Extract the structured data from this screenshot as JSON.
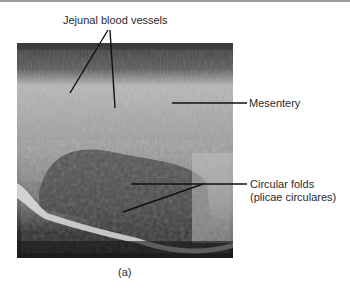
{
  "figure": {
    "caption": "(a)",
    "labels": {
      "vessels": "Jejunal blood vessels",
      "mesentery": "Mesentery",
      "folds_line1": "Circular folds",
      "folds_line2": "(plicae circulares)"
    },
    "colors": {
      "line": "#111111",
      "text": "#2a2a2a",
      "background": "#ffffff"
    }
  }
}
